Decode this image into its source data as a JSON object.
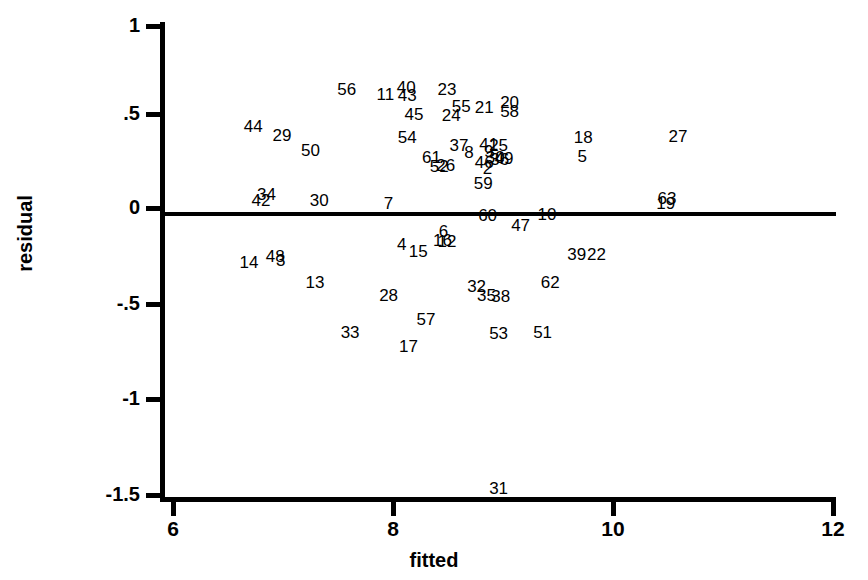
{
  "chart_data": {
    "type": "scatter",
    "title": "",
    "xlabel": "fitted",
    "ylabel": "residual",
    "xlim": [
      6,
      12
    ],
    "ylim": [
      -1.6,
      1.15
    ],
    "grid": false,
    "legend": null,
    "reference_line": {
      "type": "horizontal",
      "y": 0
    },
    "marker_style": "text-label-observation-number",
    "xticks": [
      6,
      8,
      10,
      12
    ],
    "xtick_labels": [
      "6",
      "8",
      "10",
      "12"
    ],
    "yticks": [
      1,
      0.5,
      0,
      -0.5,
      -1,
      -1.5
    ],
    "ytick_labels": [
      "1",
      ".5",
      "0",
      "-.5",
      "-1",
      "-1.5"
    ],
    "points": [
      {
        "label": "56",
        "x": 7.58,
        "y": 0.655
      },
      {
        "label": "11",
        "x": 7.93,
        "y": 0.625
      },
      {
        "label": "40",
        "x": 8.12,
        "y": 0.665
      },
      {
        "label": "43",
        "x": 8.13,
        "y": 0.62
      },
      {
        "label": "23",
        "x": 8.49,
        "y": 0.655
      },
      {
        "label": "55",
        "x": 8.62,
        "y": 0.565
      },
      {
        "label": "21",
        "x": 8.83,
        "y": 0.56
      },
      {
        "label": "20",
        "x": 9.06,
        "y": 0.585
      },
      {
        "label": "58",
        "x": 9.06,
        "y": 0.535
      },
      {
        "label": "44",
        "x": 6.73,
        "y": 0.455
      },
      {
        "label": "45",
        "x": 8.19,
        "y": 0.52
      },
      {
        "label": "24",
        "x": 8.53,
        "y": 0.515
      },
      {
        "label": "29",
        "x": 6.99,
        "y": 0.41
      },
      {
        "label": "18",
        "x": 9.73,
        "y": 0.4
      },
      {
        "label": "27",
        "x": 10.59,
        "y": 0.405
      },
      {
        "label": "54",
        "x": 8.13,
        "y": 0.395
      },
      {
        "label": "37",
        "x": 8.6,
        "y": 0.355
      },
      {
        "label": "41",
        "x": 8.87,
        "y": 0.36
      },
      {
        "label": "25",
        "x": 8.96,
        "y": 0.355
      },
      {
        "label": "50",
        "x": 7.25,
        "y": 0.33
      },
      {
        "label": "8",
        "x": 8.69,
        "y": 0.32
      },
      {
        "label": "9",
        "x": 8.87,
        "y": 0.325
      },
      {
        "label": "61",
        "x": 8.35,
        "y": 0.29
      },
      {
        "label": "30",
        "x": 8.93,
        "y": 0.29
      },
      {
        "label": "49",
        "x": 9.01,
        "y": 0.285
      },
      {
        "label": "5",
        "x": 9.72,
        "y": 0.295
      },
      {
        "label": "46",
        "x": 8.83,
        "y": 0.265
      },
      {
        "label": "36",
        "x": 8.97,
        "y": 0.28
      },
      {
        "label": "52",
        "x": 8.42,
        "y": 0.245
      },
      {
        "label": "26",
        "x": 8.48,
        "y": 0.25
      },
      {
        "label": "2",
        "x": 8.86,
        "y": 0.23
      },
      {
        "label": "34",
        "x": 6.85,
        "y": 0.095
      },
      {
        "label": "42",
        "x": 6.8,
        "y": 0.06
      },
      {
        "label": "59",
        "x": 8.82,
        "y": 0.155
      },
      {
        "label": "63",
        "x": 10.49,
        "y": 0.075
      },
      {
        "label": "19",
        "x": 10.48,
        "y": 0.045
      },
      {
        "label": "30b",
        "x": 7.33,
        "y": 0.06
      },
      {
        "label": "7",
        "x": 7.96,
        "y": 0.045
      },
      {
        "label": "60",
        "x": 8.86,
        "y": -0.02
      },
      {
        "label": "10",
        "x": 9.4,
        "y": -0.015
      },
      {
        "label": "47",
        "x": 9.16,
        "y": -0.07
      },
      {
        "label": "6",
        "x": 8.46,
        "y": -0.105
      },
      {
        "label": "16",
        "x": 8.45,
        "y": -0.15
      },
      {
        "label": "12",
        "x": 8.49,
        "y": -0.155
      },
      {
        "label": "4",
        "x": 8.08,
        "y": -0.175
      },
      {
        "label": "15",
        "x": 8.23,
        "y": -0.21
      },
      {
        "label": "48",
        "x": 6.93,
        "y": -0.235
      },
      {
        "label": "3",
        "x": 6.98,
        "y": -0.26
      },
      {
        "label": "14",
        "x": 6.69,
        "y": -0.27
      },
      {
        "label": "39",
        "x": 9.67,
        "y": -0.225
      },
      {
        "label": "22",
        "x": 9.85,
        "y": -0.225
      },
      {
        "label": "13",
        "x": 7.29,
        "y": -0.375
      },
      {
        "label": "62",
        "x": 9.43,
        "y": -0.375
      },
      {
        "label": "32",
        "x": 8.76,
        "y": -0.395
      },
      {
        "label": "28",
        "x": 7.96,
        "y": -0.445
      },
      {
        "label": "35",
        "x": 8.85,
        "y": -0.445
      },
      {
        "label": "38",
        "x": 8.98,
        "y": -0.45
      },
      {
        "label": "57",
        "x": 8.3,
        "y": -0.575
      },
      {
        "label": "33",
        "x": 7.61,
        "y": -0.64
      },
      {
        "label": "53",
        "x": 8.96,
        "y": -0.645
      },
      {
        "label": "51",
        "x": 9.36,
        "y": -0.64
      },
      {
        "label": "17",
        "x": 8.14,
        "y": -0.715
      },
      {
        "label": "31",
        "x": 8.96,
        "y": -1.475
      }
    ]
  },
  "axes": {
    "x_title": "fitted",
    "y_title": "residual",
    "x_tick_labels": [
      "6",
      "8",
      "10",
      "12"
    ],
    "y_tick_labels": [
      "1",
      ".5",
      "0",
      "-.5",
      "-1",
      "-1.5"
    ]
  }
}
